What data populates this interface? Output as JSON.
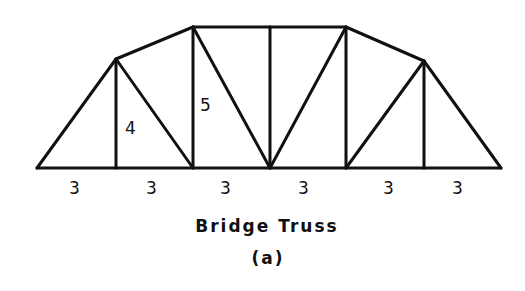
{
  "figure": {
    "title": "Bridge Truss",
    "sublabel": "(a)",
    "colors": {
      "line": "#111111",
      "background": "#ffffff"
    }
  },
  "truss": {
    "nodes": {
      "L0": [
        37,
        168
      ],
      "L1": [
        116,
        168
      ],
      "L2": [
        193,
        168
      ],
      "L3": [
        270,
        168
      ],
      "L4": [
        346,
        168
      ],
      "L5": [
        424,
        168
      ],
      "L6": [
        501,
        168
      ],
      "U1": [
        116,
        59
      ],
      "U2": [
        193,
        27
      ],
      "U3": [
        270,
        27
      ],
      "U4": [
        346,
        27
      ],
      "U5": [
        424,
        61
      ]
    },
    "members": [
      [
        "L0",
        "L6"
      ],
      [
        "L0",
        "U1"
      ],
      [
        "U1",
        "U2"
      ],
      [
        "U2",
        "U3"
      ],
      [
        "U3",
        "U4"
      ],
      [
        "U4",
        "U5"
      ],
      [
        "U5",
        "L6"
      ],
      [
        "U1",
        "L1"
      ],
      [
        "U1",
        "L2"
      ],
      [
        "U2",
        "L2"
      ],
      [
        "U2",
        "L3"
      ],
      [
        "U3",
        "L3"
      ],
      [
        "U4",
        "L3"
      ],
      [
        "U4",
        "L4"
      ],
      [
        "U5",
        "L4"
      ],
      [
        "U5",
        "L5"
      ]
    ],
    "panel_widths": [
      "3",
      "3",
      "3",
      "3",
      "3",
      "3"
    ],
    "heights": [
      {
        "label": "4",
        "member": "U1-L1"
      },
      {
        "label": "5",
        "member": "U2-L2"
      }
    ]
  }
}
